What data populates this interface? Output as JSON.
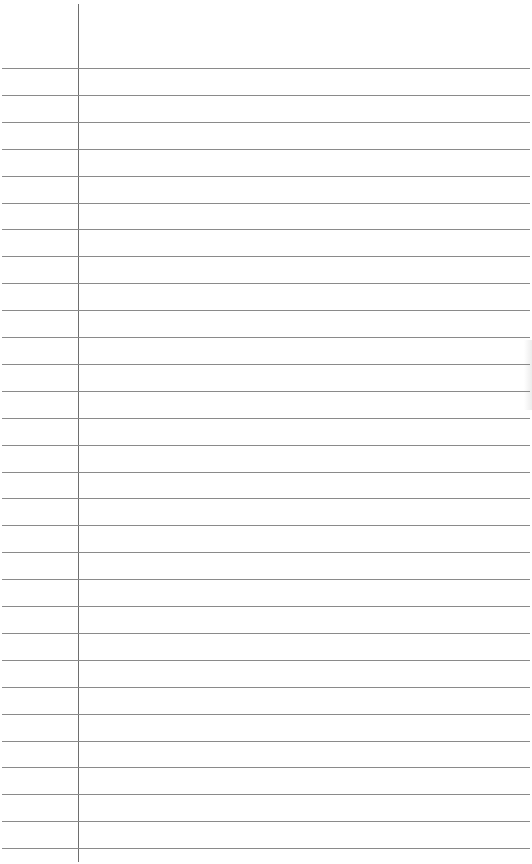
{
  "sheet": {
    "type": "lined-paper",
    "background": "#ffffff",
    "rule_color": "#8a8a8a",
    "margin_color": "#6e6e6e",
    "margin_x": 78,
    "first_rule_y": 68,
    "rule_spacing": 26.9,
    "rule_count": 30
  }
}
